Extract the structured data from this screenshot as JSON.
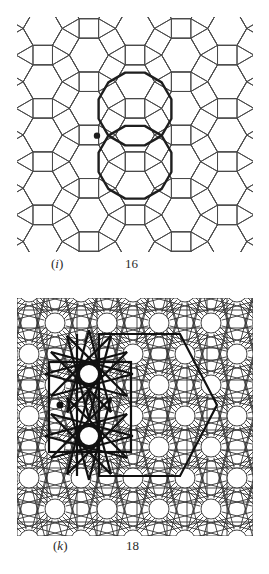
{
  "figures": [
    {
      "id": "i",
      "label_letter": "(i)",
      "label_letter_char": "i",
      "label_number": "16",
      "pattern": "semiregular-3.4.6.4-tiling",
      "highlight": "two-dodecagon-outline-with-dot",
      "colors": {
        "line": "#4a4a4a",
        "bold": "#1e1e1e"
      }
    },
    {
      "id": "k",
      "label_letter": "(k)",
      "label_letter_char": "k",
      "label_number": "18",
      "pattern": "star-and-circle-lattice",
      "highlight": "double-twelve-point-star-with-hexagon-outline",
      "colors": {
        "line": "#333333",
        "bold": "#111111"
      }
    }
  ]
}
